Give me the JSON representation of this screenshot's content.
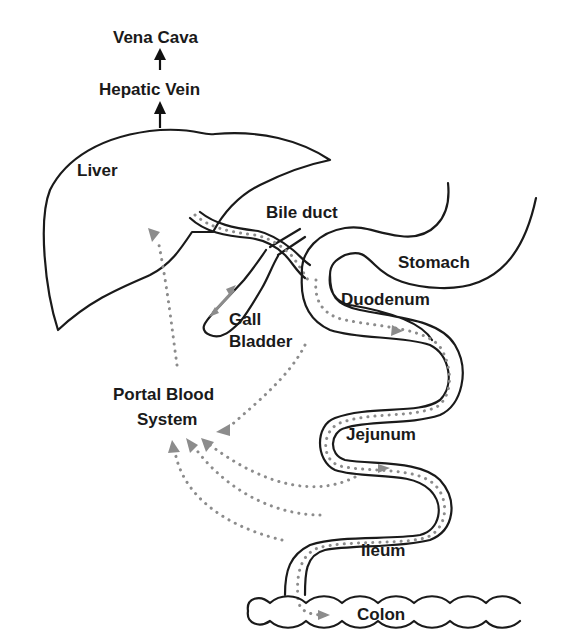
{
  "labels": {
    "vena_cava": "Vena Cava",
    "hepatic_vein": "Hepatic Vein",
    "liver": "Liver",
    "bile_duct": "Bile duct",
    "stomach": "Stomach",
    "duodenum": "Duodenum",
    "gall": "Gall",
    "bladder": "Bladder",
    "portal_blood": "Portal Blood",
    "system": "System",
    "jejunum": "Jejunum",
    "ileum": "Ileum",
    "colon": "Colon"
  },
  "colors": {
    "outline": "#1a1a1a",
    "flow_dots": "#8c8c8c",
    "background": "#ffffff"
  },
  "flows": [
    {
      "from": "Liver",
      "via": "Bile duct",
      "to": "Duodenum"
    },
    {
      "from": "Gall Bladder",
      "to": "Bile duct",
      "bidirectional": true
    },
    {
      "from": "Duodenum",
      "to": "Jejunum"
    },
    {
      "from": "Jejunum",
      "to": "Ileum"
    },
    {
      "from": "Ileum",
      "to": "Colon"
    },
    {
      "from": "Duodenum",
      "to": "Portal Blood System"
    },
    {
      "from": "Jejunum",
      "to": "Portal Blood System"
    },
    {
      "from": "Ileum",
      "to": "Portal Blood System"
    },
    {
      "from": "Colon",
      "to": "Portal Blood System"
    },
    {
      "from": "Portal Blood System",
      "to": "Liver"
    },
    {
      "from": "Liver",
      "to": "Hepatic Vein"
    },
    {
      "from": "Hepatic Vein",
      "to": "Vena Cava"
    }
  ]
}
